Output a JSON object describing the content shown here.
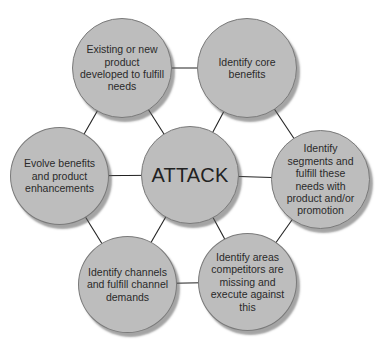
{
  "diagram": {
    "type": "hub-and-spoke hexagon",
    "center": {
      "label": "ATTACK"
    },
    "nodes": [
      {
        "id": "top-left",
        "label": "Existing or new product developed to fulfill needs"
      },
      {
        "id": "top-right",
        "label": "Identify core benefits"
      },
      {
        "id": "right",
        "label": "Identify segments and fulfill these needs with product and/or promotion"
      },
      {
        "id": "bottom-right",
        "label": "Identify areas competitors are missing and execute against this"
      },
      {
        "id": "bottom-left",
        "label": "Identify channels and fulfill channel demands"
      },
      {
        "id": "left",
        "label": "Evolve benefits and product enhancements"
      }
    ],
    "colors": {
      "node_fill": "#bdbdbd",
      "node_border": "#7a7a7a",
      "line": "#222222",
      "text": "#2a2a2a"
    }
  }
}
